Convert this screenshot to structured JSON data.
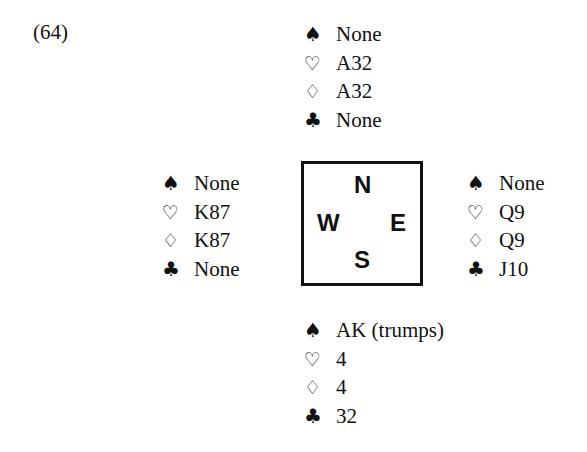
{
  "problem_label": "(64)",
  "suit_icons": {
    "spades": "♠",
    "hearts": "♡",
    "diamonds": "♢",
    "clubs": "♣"
  },
  "compass": {
    "north": "N",
    "west": "W",
    "east": "E",
    "south": "S"
  },
  "hands": {
    "north": {
      "spades": "None",
      "hearts": "A32",
      "diamonds": "A32",
      "clubs": "None"
    },
    "west": {
      "spades": "None",
      "hearts": "K87",
      "diamonds": "K87",
      "clubs": "None"
    },
    "east": {
      "spades": "None",
      "hearts": "Q9",
      "diamonds": "Q9",
      "clubs": "J10"
    },
    "south": {
      "spades": "AK (trumps)",
      "hearts": "4",
      "diamonds": "4",
      "clubs": "32"
    }
  }
}
